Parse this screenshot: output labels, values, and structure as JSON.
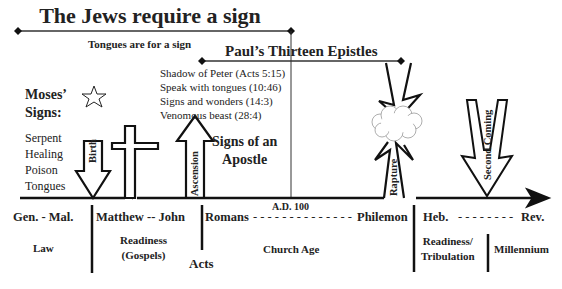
{
  "title": "The Jews require a sign",
  "subtitle": "Tongues are for a sign",
  "epistles_heading": "Paul’s Thirteen Epistles",
  "acts_signs": [
    "Shadow of Peter (Acts 5:15)",
    "Speak with tongues (10:46)",
    "Signs and wonders (14:3)",
    "Venomous beast (28:4)"
  ],
  "moses": {
    "heading_line1": "Moses’",
    "heading_line2": "Signs:",
    "items": [
      "Serpent",
      "Healing",
      "Poison",
      "Tongues"
    ],
    "icon": "star-icon"
  },
  "apostle": {
    "line1": "Signs of an",
    "line2": "Apostle"
  },
  "arrows": {
    "birth": "Birth",
    "ascension": "Ascension",
    "rapture": "Rapture",
    "second_coming": "Second Coming"
  },
  "timeline": {
    "books": {
      "gen_mal": "Gen. - Mal.",
      "matthew_john": "Matthew -- John",
      "romans": "Romans",
      "dashes1": "- - - - - - - - - - - - - -",
      "ad100": "A.D. 100",
      "philemon": "Philemon",
      "heb": "Heb.",
      "dashes2": "- - - - - - - -",
      "rev": "Rev."
    },
    "eras": {
      "law": "Law",
      "readiness1": "Readiness",
      "gospels": "(Gospels)",
      "acts": "Acts",
      "church_age": "Church Age",
      "readiness2": "Readiness/",
      "tribulation": "Tribulation",
      "millennium": "Millennium"
    }
  }
}
